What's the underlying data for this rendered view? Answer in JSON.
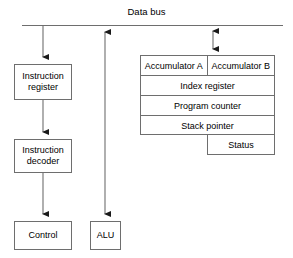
{
  "diagram": {
    "title": "Data bus",
    "bus": {
      "label": "Data bus",
      "line_color": "#6e6e6e"
    },
    "nodes": [
      {
        "id": "instruction-register",
        "label": "Instruction\nregister",
        "line1": "Instruction",
        "line2": "register"
      },
      {
        "id": "instruction-decoder",
        "label": "Instruction\ndecoder",
        "line1": "Instruction",
        "line2": "decoder"
      },
      {
        "id": "control",
        "label": "Control"
      },
      {
        "id": "alu",
        "label": "ALU"
      }
    ],
    "registers": {
      "rows": [
        {
          "type": "split",
          "left": "Accumulator A",
          "right": "Accumulator B"
        },
        {
          "type": "full",
          "label": "Index register"
        },
        {
          "type": "full",
          "label": "Program counter"
        },
        {
          "type": "full",
          "label": "Stack pointer"
        }
      ],
      "status": {
        "label": "Status"
      }
    },
    "connections": [
      {
        "from": "data-bus",
        "to": "instruction-register",
        "arrow": "single-down"
      },
      {
        "from": "instruction-register",
        "to": "instruction-decoder",
        "arrow": "single-down"
      },
      {
        "from": "instruction-decoder",
        "to": "control",
        "arrow": "single-down"
      },
      {
        "from": "data-bus",
        "to": "alu",
        "arrow": "double"
      },
      {
        "from": "data-bus",
        "to": "registers",
        "arrow": "double"
      }
    ],
    "colors": {
      "stroke": "#6e6e6e",
      "arrow": "#1a1a1a",
      "background": "#ffffff",
      "text": "#000000"
    }
  }
}
